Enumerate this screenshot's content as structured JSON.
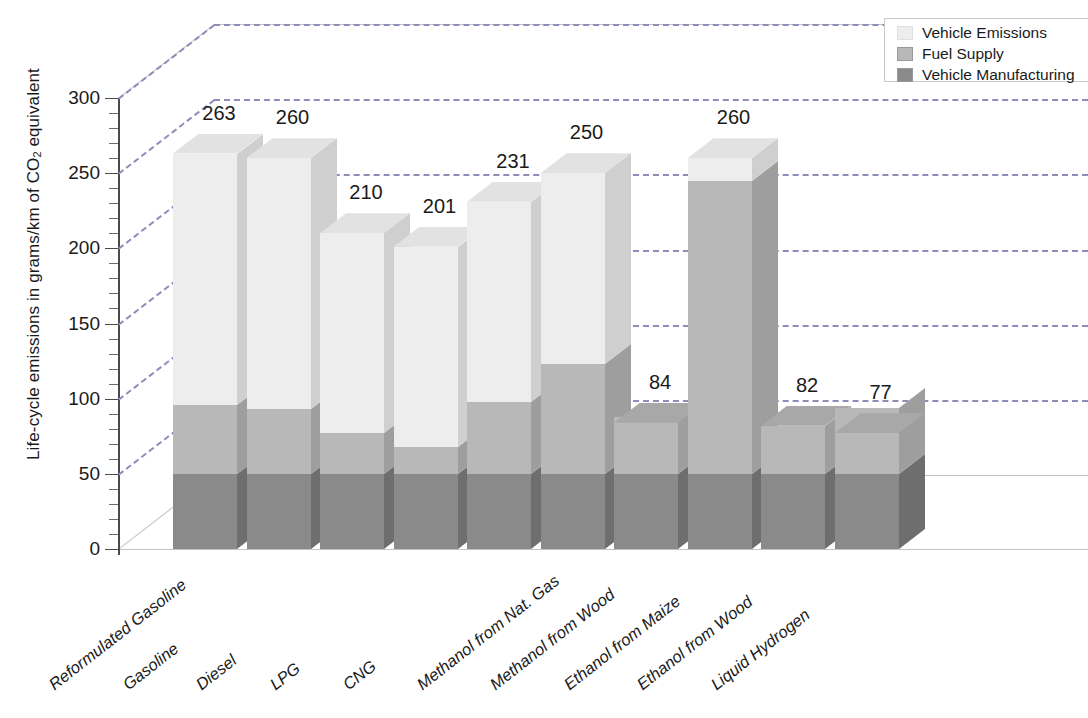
{
  "chart_data": {
    "type": "bar",
    "subtype": "stacked-3d-column",
    "title": "",
    "xlabel": "",
    "ylabel": "Life-cycle emissions in grams/km of CO₂ equivalent",
    "ylim": [
      0,
      300
    ],
    "ytick_labels": [
      "0",
      "50",
      "100",
      "150",
      "200",
      "250",
      "300"
    ],
    "ytick_values": [
      0,
      50,
      100,
      150,
      200,
      250,
      300
    ],
    "minor_tick_step": 10,
    "grid": "dashed horizontal gridlines every 50 units",
    "legend_position": "top-right",
    "categories": [
      "Reformulated Gasoline",
      "Gasoline",
      "Diesel",
      "LPG",
      "CNG",
      "Methanol from Nat. Gas",
      "Methanol from Wood",
      "Ethanol from Maize",
      "Ethanol from Wood",
      "Liquid Hydrogen"
    ],
    "series": [
      {
        "name": "Vehicle Manufacturing",
        "color": "#8a8a8a",
        "values": [
          50,
          50,
          50,
          50,
          50,
          50,
          50,
          50,
          50,
          50
        ]
      },
      {
        "name": "Fuel Supply",
        "color": "#b8b8b8",
        "values": [
          46,
          43,
          27,
          18,
          48,
          73,
          38,
          32,
          195,
          44
        ]
      },
      {
        "name": "Vehicle Emissions",
        "color": "#ededed",
        "values": [
          167,
          167,
          133,
          133,
          133,
          127,
          0,
          0,
          15,
          0
        ]
      }
    ],
    "totals": [
      263,
      260,
      210,
      201,
      231,
      250,
      84,
      260,
      82,
      77
    ],
    "bars": [
      {
        "category": "Reformulated Gasoline",
        "total": 263,
        "manufacturing": 50,
        "fuel_supply": 46,
        "emissions": 167,
        "label": "263"
      },
      {
        "category": "Gasoline",
        "total": 260,
        "manufacturing": 50,
        "fuel_supply": 43,
        "emissions": 167,
        "label": "260"
      },
      {
        "category": "Diesel",
        "total": 210,
        "manufacturing": 50,
        "fuel_supply": 27,
        "emissions": 133,
        "label": "210"
      },
      {
        "category": "LPG",
        "total": 201,
        "manufacturing": 50,
        "fuel_supply": 18,
        "emissions": 133,
        "label": "201"
      },
      {
        "category": "CNG",
        "total": 231,
        "manufacturing": 50,
        "fuel_supply": 48,
        "emissions": 133,
        "label": "231"
      },
      {
        "category": "Methanol from Nat. Gas",
        "total": 250,
        "manufacturing": 50,
        "fuel_supply": 73,
        "emissions": 127,
        "label": "250"
      },
      {
        "category": "Methanol from Wood",
        "total": 84,
        "manufacturing": 50,
        "fuel_supply": 38,
        "emissions": 0,
        "label": "84"
      },
      {
        "category": "Ethanol from Maize",
        "total": 260,
        "manufacturing": 50,
        "fuel_supply": 195,
        "emissions": 15,
        "label": "260"
      },
      {
        "category": "Ethanol from Wood",
        "total": 82,
        "manufacturing": 50,
        "fuel_supply": 32,
        "emissions": 0,
        "label": "82"
      },
      {
        "category": "Liquid Hydrogen",
        "total": 77,
        "manufacturing": 50,
        "fuel_supply": 44,
        "emissions": 0,
        "label": "77"
      }
    ]
  },
  "axis": {
    "y_title_main": "Life-cycle emissions in grams/km of CO",
    "y_title_sub": "2",
    "y_title_tail": " equivalent",
    "ticks": [
      "300",
      "250",
      "200",
      "150",
      "100",
      "50",
      "0"
    ]
  },
  "legend": {
    "items": [
      {
        "label": "Vehicle Emissions",
        "color": "#ededed"
      },
      {
        "label": "Fuel Supply",
        "color": "#b8b8b8"
      },
      {
        "label": "Vehicle Manufacturing",
        "color": "#8a8a8a"
      }
    ]
  },
  "categories": [
    "Reformulated Gasoline",
    "Gasoline",
    "Diesel",
    "LPG",
    "CNG",
    "Methanol from Nat. Gas",
    "Methanol from Wood",
    "Ethanol from Maize",
    "Ethanol from Wood",
    "Liquid Hydrogen"
  ],
  "value_labels": [
    "263",
    "260",
    "210",
    "201",
    "231",
    "250",
    "84",
    "260",
    "82",
    "77"
  ]
}
